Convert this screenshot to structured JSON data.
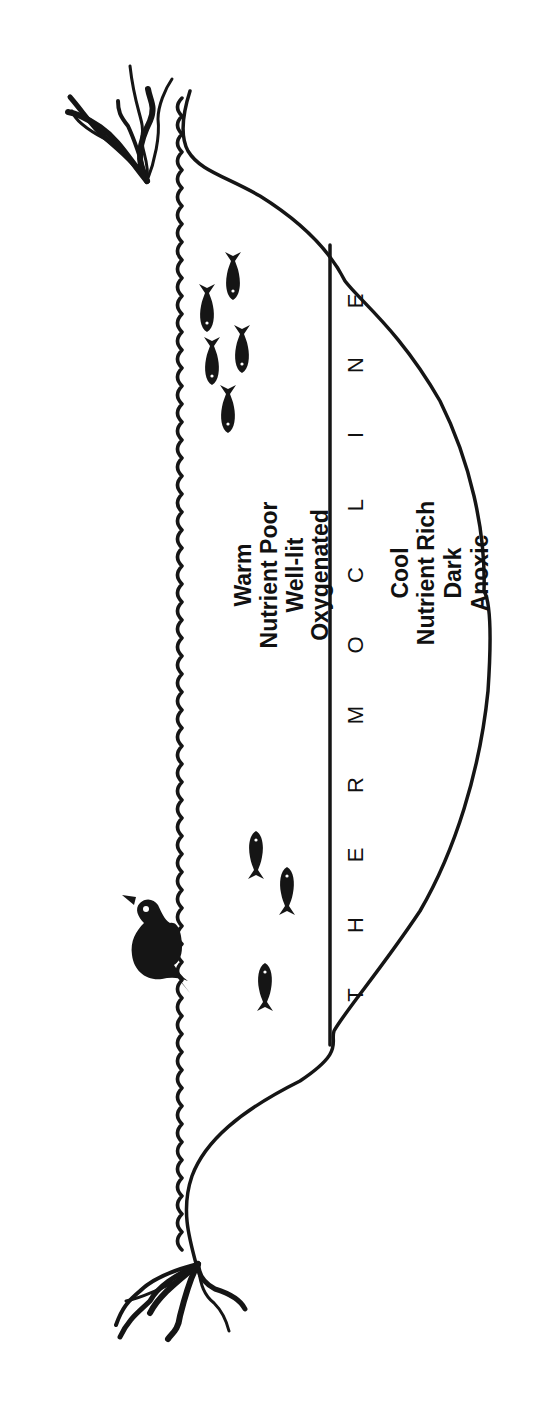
{
  "diagram": {
    "orientation": "rotated 90 degrees counterclockwise",
    "upper_layer": {
      "lines": [
        "Warm",
        "Nutrient Poor",
        "Well-lit",
        "Oxygenated"
      ]
    },
    "boundary": {
      "label": "THERMOCLINE",
      "letters": [
        "T",
        "H",
        "E",
        "R",
        "M",
        "O",
        "C",
        "L",
        "I",
        "N",
        "E"
      ]
    },
    "lower_layer": {
      "lines": [
        "Cool",
        "Nutrient Rich",
        "Dark",
        "Anoxic"
      ]
    },
    "figures": [
      {
        "name": "duck",
        "count": 1
      },
      {
        "name": "fish-left-group",
        "count": 3
      },
      {
        "name": "fish-right-group",
        "count": 5
      },
      {
        "name": "shore-plant",
        "count": 2
      }
    ],
    "colors": {
      "ink": "#151515",
      "background": "#ffffff"
    }
  }
}
